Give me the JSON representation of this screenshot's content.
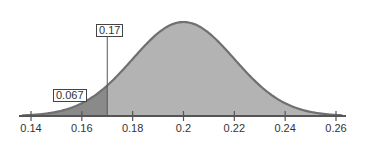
{
  "chart_data": {
    "type": "area",
    "title": "",
    "distribution": {
      "kind": "normal",
      "mean": 0.2,
      "sd": 0.02
    },
    "cutoff": {
      "value": 0.17,
      "label": "0.17"
    },
    "shaded_area": {
      "region": "x < 0.17",
      "value": 0.067,
      "label": "0.067"
    },
    "x_ticks": [
      0.14,
      0.16,
      0.18,
      0.2,
      0.22,
      0.24,
      0.26
    ],
    "x_tick_labels": [
      "0.14",
      "0.16",
      "0.18",
      "0.2",
      "0.22",
      "0.24",
      "0.26"
    ],
    "xlim": [
      0.137,
      0.265
    ],
    "xlabel": "",
    "ylabel": "",
    "grid": false,
    "colors": {
      "curve_fill": "#b3b3b3",
      "tail_fill": "#8a8a8a",
      "curve_line": "#707070",
      "axis": "#555555"
    }
  }
}
